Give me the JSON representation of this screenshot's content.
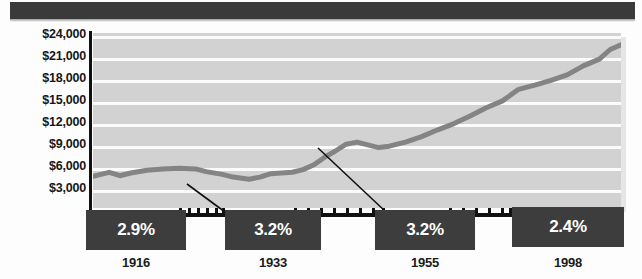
{
  "chart_data": {
    "type": "line",
    "title": "",
    "subtitle": "",
    "xlabel": "",
    "ylabel": "",
    "grid": true,
    "legend": "none",
    "ylim": [
      0,
      25500
    ],
    "ytick_labels": [
      "$24,000",
      "$21,000",
      "$18,000",
      "$15,000",
      "$12,000",
      "$9,000",
      "$6,000",
      "$3,000"
    ],
    "ytick_values": [
      24000,
      21000,
      18000,
      15000,
      12000,
      9000,
      6000,
      3000
    ],
    "xlim": [
      1900,
      1998
    ],
    "xtick_labels": [
      "1916",
      "1933",
      "1955",
      "1998"
    ],
    "series": [
      {
        "name": "value",
        "color": "#848484",
        "x": [
          1900,
          1903,
          1905,
          1907,
          1910,
          1913,
          1916,
          1919,
          1921,
          1924,
          1926,
          1929,
          1931,
          1933,
          1935,
          1937,
          1939,
          1941,
          1943,
          1945,
          1947,
          1949,
          1951,
          1953,
          1955,
          1958,
          1961,
          1964,
          1967,
          1970,
          1973,
          1976,
          1979,
          1982,
          1985,
          1988,
          1991,
          1994,
          1996,
          1998
        ],
        "y": [
          4600,
          5200,
          4700,
          5100,
          5500,
          5700,
          5800,
          5700,
          5300,
          4900,
          4500,
          4200,
          4500,
          5000,
          5100,
          5200,
          5600,
          6300,
          7400,
          8300,
          9300,
          9600,
          9200,
          8800,
          9000,
          9600,
          10400,
          11400,
          12300,
          13400,
          14600,
          15600,
          17300,
          17900,
          18600,
          19400,
          20700,
          21700,
          23100,
          23800
        ]
      }
    ],
    "annotations": [
      {
        "label": "2.9%",
        "period_label": "1916",
        "value": 2.9
      },
      {
        "label": "3.2%",
        "period_label": "1933",
        "value": 3.2
      },
      {
        "label": "3.2%",
        "period_label": "1955",
        "value": 3.2
      },
      {
        "label": "2.4%",
        "period_label": "1998",
        "value": 2.4
      }
    ],
    "colors": {
      "plot_background": "#d2d2d2",
      "gridline": "#fbfbfb",
      "series_line": "#848484",
      "box_fill": "#3d3d3d",
      "box_text": "#ffffff",
      "axis": "#111111",
      "banner": "#3a3a3a"
    }
  }
}
